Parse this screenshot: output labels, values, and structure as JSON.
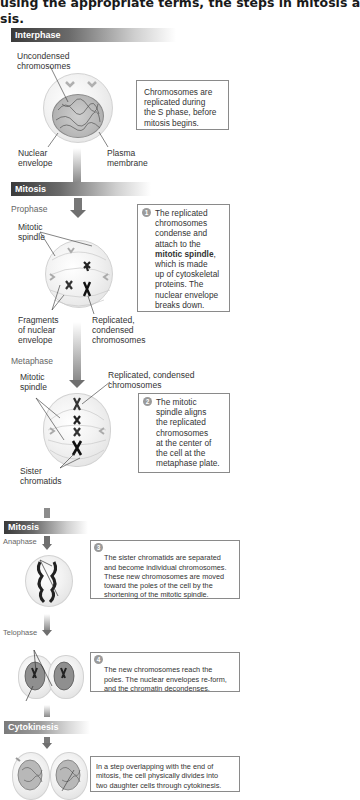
{
  "title": "using the appropriate terms, the steps in mitosis a",
  "title_line2": "sis.",
  "interphase": {
    "band_label": "Interphase",
    "labels": {
      "uncondensed_1": "Uncondensed",
      "uncondensed_2": "chromosomes",
      "nuclear_1": "Nuclear",
      "nuclear_2": "envelope",
      "plasma_1": "Plasma",
      "plasma_2": "membrane"
    },
    "box_lines": [
      "Chromosomes are",
      "replicated during",
      "the S phase, before",
      "mitosis begins."
    ]
  },
  "mitosis1": {
    "band_label": "Mitosis",
    "prophase": {
      "phase_label": "Prophase",
      "labels": {
        "spindle_1": "Mitotic",
        "spindle_2": "spindle",
        "fragments_1": "Fragments",
        "fragments_2": "of nuclear",
        "fragments_3": "envelope",
        "replicated_1": "Replicated,",
        "replicated_2": "condensed",
        "replicated_3": "chromosomes"
      },
      "step_number": "1",
      "box_lines": [
        "The replicated",
        "chromosomes",
        "condense and",
        "attach to the"
      ],
      "box_bold": "mitotic spindle",
      "box_bold_suffix": ",",
      "box_lines_after": [
        "which is made",
        "up of cytoskeletal",
        "proteins. The",
        "nuclear envelope",
        "breaks down."
      ]
    },
    "metaphase": {
      "phase_label": "Metaphase",
      "labels": {
        "spindle_1": "Mitotic",
        "spindle_2": "spindle",
        "replicated_1": "Replicated, condensed",
        "replicated_2": "chromosomes",
        "sister_1": "Sister",
        "sister_2": "chromatids"
      },
      "step_number": "2",
      "box_lines": [
        "The mitotic",
        "spindle aligns",
        "the replicated",
        "chromosomes",
        "at the center of",
        "the cell at the",
        "metaphase plate."
      ]
    }
  },
  "mitosis2": {
    "band_label": "Mitosis",
    "anaphase": {
      "phase_label": "Anaphase",
      "step_number": "3",
      "box_lines": [
        "The sister chromatids are separated",
        "and become individual chromosomes.",
        "These new chromosomes are moved",
        "toward the poles of the cell by the",
        "shortening of the mitotic spindle."
      ]
    },
    "telophase": {
      "phase_label": "Telophase",
      "step_number": "4",
      "box_lines": [
        "The new chromosomes reach the",
        "poles. The nuclear envelopes re-form,",
        "and the chromatin decondenses."
      ]
    }
  },
  "cytokinesis": {
    "band_label": "Cytokinesis",
    "box_lines": [
      "In a step overlapping with the end of",
      "mitosis, the cell physically divides into",
      "two daughter cells through cytokinesis."
    ]
  }
}
